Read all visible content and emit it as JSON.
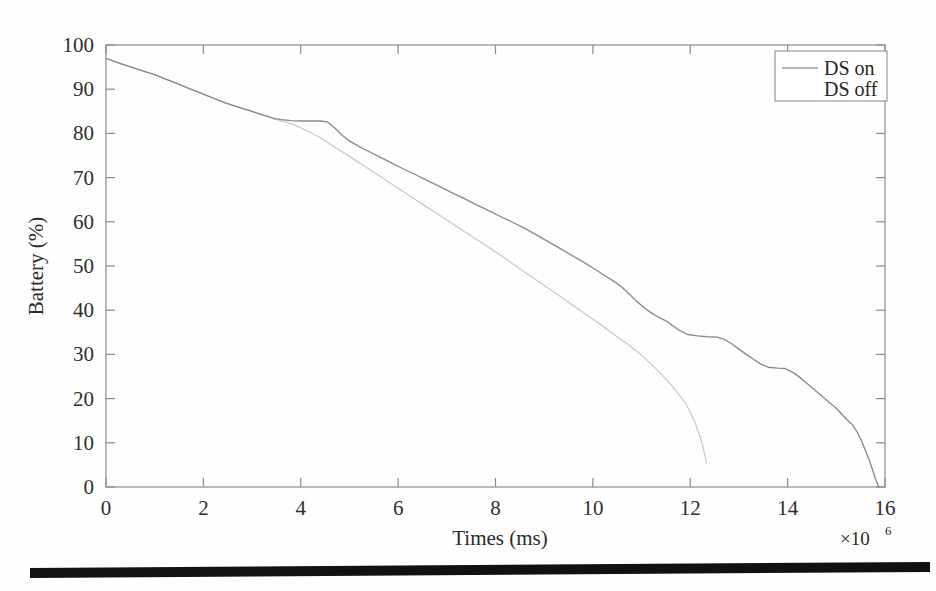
{
  "chart_data": {
    "type": "line",
    "title": "",
    "subtitle": "",
    "xlabel": "Times (ms)",
    "ylabel": "Battery (%)",
    "x_multiplier": "×10",
    "x_multiplier_exponent": "6",
    "xlim": [
      0,
      16
    ],
    "ylim": [
      0,
      100
    ],
    "xticks": [
      0,
      2,
      4,
      6,
      8,
      10,
      12,
      14,
      16
    ],
    "yticks": [
      0,
      10,
      20,
      30,
      40,
      50,
      60,
      70,
      80,
      90,
      100
    ],
    "xtick_labels": [
      "0",
      "2",
      "4",
      "6",
      "8",
      "10",
      "12",
      "14",
      "16"
    ],
    "ytick_labels": [
      "0",
      "10",
      "20",
      "30",
      "40",
      "50",
      "60",
      "70",
      "80",
      "90",
      "100"
    ],
    "grid": false,
    "legend_position": "top-right",
    "legend_entries": [
      "DS on",
      "DS off"
    ],
    "series": [
      {
        "name": "DS on",
        "color": "#8a8a8a",
        "points": [
          [
            0.0,
            97.0
          ],
          [
            0.1,
            96.6
          ],
          [
            0.3,
            95.8
          ],
          [
            0.55,
            94.9
          ],
          [
            0.8,
            94.0
          ],
          [
            1.0,
            93.3
          ],
          [
            1.2,
            92.4
          ],
          [
            1.45,
            91.3
          ],
          [
            1.7,
            90.2
          ],
          [
            1.95,
            89.1
          ],
          [
            2.2,
            88.0
          ],
          [
            2.45,
            86.9
          ],
          [
            2.7,
            86.0
          ],
          [
            2.9,
            85.3
          ],
          [
            3.1,
            84.6
          ],
          [
            3.3,
            83.9
          ],
          [
            3.45,
            83.4
          ],
          [
            3.6,
            83.1
          ],
          [
            3.8,
            82.9
          ],
          [
            4.0,
            82.8
          ],
          [
            4.2,
            82.8
          ],
          [
            4.4,
            82.8
          ],
          [
            4.55,
            82.6
          ],
          [
            4.7,
            81.2
          ],
          [
            4.85,
            79.6
          ],
          [
            5.0,
            78.3
          ],
          [
            5.2,
            77.0
          ],
          [
            5.4,
            75.9
          ],
          [
            5.6,
            74.8
          ],
          [
            5.85,
            73.4
          ],
          [
            6.1,
            72.0
          ],
          [
            6.35,
            70.7
          ],
          [
            6.6,
            69.3
          ],
          [
            6.85,
            68.0
          ],
          [
            7.1,
            66.6
          ],
          [
            7.35,
            65.3
          ],
          [
            7.6,
            63.9
          ],
          [
            7.85,
            62.6
          ],
          [
            8.1,
            61.2
          ],
          [
            8.35,
            59.9
          ],
          [
            8.6,
            58.5
          ],
          [
            8.85,
            57.0
          ],
          [
            9.1,
            55.4
          ],
          [
            9.35,
            53.8
          ],
          [
            9.6,
            52.2
          ],
          [
            9.85,
            50.6
          ],
          [
            10.05,
            49.2
          ],
          [
            10.25,
            47.8
          ],
          [
            10.45,
            46.4
          ],
          [
            10.6,
            45.2
          ],
          [
            10.75,
            43.6
          ],
          [
            10.9,
            42.0
          ],
          [
            11.05,
            40.6
          ],
          [
            11.2,
            39.4
          ],
          [
            11.35,
            38.4
          ],
          [
            11.5,
            37.6
          ],
          [
            11.65,
            36.4
          ],
          [
            11.8,
            35.3
          ],
          [
            11.95,
            34.5
          ],
          [
            12.15,
            34.2
          ],
          [
            12.35,
            34.0
          ],
          [
            12.55,
            33.9
          ],
          [
            12.7,
            33.4
          ],
          [
            12.85,
            32.4
          ],
          [
            13.0,
            31.2
          ],
          [
            13.15,
            30.0
          ],
          [
            13.3,
            28.9
          ],
          [
            13.45,
            27.8
          ],
          [
            13.6,
            27.1
          ],
          [
            13.8,
            26.9
          ],
          [
            13.95,
            26.8
          ],
          [
            14.1,
            26.0
          ],
          [
            14.25,
            24.8
          ],
          [
            14.4,
            23.4
          ],
          [
            14.55,
            22.0
          ],
          [
            14.7,
            20.6
          ],
          [
            14.85,
            19.2
          ],
          [
            15.0,
            17.8
          ],
          [
            15.12,
            16.4
          ],
          [
            15.22,
            15.2
          ],
          [
            15.32,
            14.2
          ],
          [
            15.42,
            12.6
          ],
          [
            15.52,
            10.4
          ],
          [
            15.6,
            8.2
          ],
          [
            15.68,
            6.0
          ],
          [
            15.74,
            4.0
          ],
          [
            15.8,
            2.0
          ],
          [
            15.85,
            0.6
          ],
          [
            15.88,
            0.0
          ]
        ]
      },
      {
        "name": "DS off",
        "color": "#c9c9c9",
        "points": [
          [
            0.0,
            97.0
          ],
          [
            0.1,
            96.6
          ],
          [
            0.3,
            95.8
          ],
          [
            0.55,
            94.9
          ],
          [
            0.8,
            94.0
          ],
          [
            1.0,
            93.3
          ],
          [
            1.2,
            92.4
          ],
          [
            1.45,
            91.3
          ],
          [
            1.7,
            90.2
          ],
          [
            1.95,
            89.1
          ],
          [
            2.2,
            88.0
          ],
          [
            2.45,
            86.9
          ],
          [
            2.7,
            86.0
          ],
          [
            2.9,
            85.3
          ],
          [
            3.1,
            84.6
          ],
          [
            3.3,
            83.9
          ],
          [
            3.45,
            83.3
          ],
          [
            3.6,
            82.8
          ],
          [
            3.8,
            82.2
          ],
          [
            4.0,
            81.3
          ],
          [
            4.2,
            80.2
          ],
          [
            4.4,
            79.0
          ],
          [
            4.6,
            77.6
          ],
          [
            4.8,
            76.2
          ],
          [
            5.0,
            74.8
          ],
          [
            5.25,
            73.0
          ],
          [
            5.5,
            71.2
          ],
          [
            5.75,
            69.4
          ],
          [
            6.0,
            67.6
          ],
          [
            6.25,
            65.8
          ],
          [
            6.5,
            64.0
          ],
          [
            6.75,
            62.2
          ],
          [
            7.0,
            60.4
          ],
          [
            7.25,
            58.6
          ],
          [
            7.5,
            56.8
          ],
          [
            7.75,
            55.0
          ],
          [
            8.0,
            53.2
          ],
          [
            8.25,
            51.3
          ],
          [
            8.5,
            49.4
          ],
          [
            8.75,
            47.5
          ],
          [
            9.0,
            45.6
          ],
          [
            9.25,
            43.7
          ],
          [
            9.5,
            41.8
          ],
          [
            9.75,
            39.9
          ],
          [
            10.0,
            38.0
          ],
          [
            10.25,
            36.0
          ],
          [
            10.5,
            34.0
          ],
          [
            10.75,
            32.0
          ],
          [
            11.0,
            29.8
          ],
          [
            11.2,
            27.8
          ],
          [
            11.4,
            25.6
          ],
          [
            11.6,
            23.2
          ],
          [
            11.75,
            21.2
          ],
          [
            11.9,
            19.0
          ],
          [
            12.0,
            17.0
          ],
          [
            12.1,
            14.5
          ],
          [
            12.18,
            12.0
          ],
          [
            12.25,
            9.6
          ],
          [
            12.3,
            7.2
          ],
          [
            12.34,
            5.4
          ]
        ]
      }
    ]
  },
  "artifacts": {
    "scan_bar_label": "scan-edge-bar"
  }
}
